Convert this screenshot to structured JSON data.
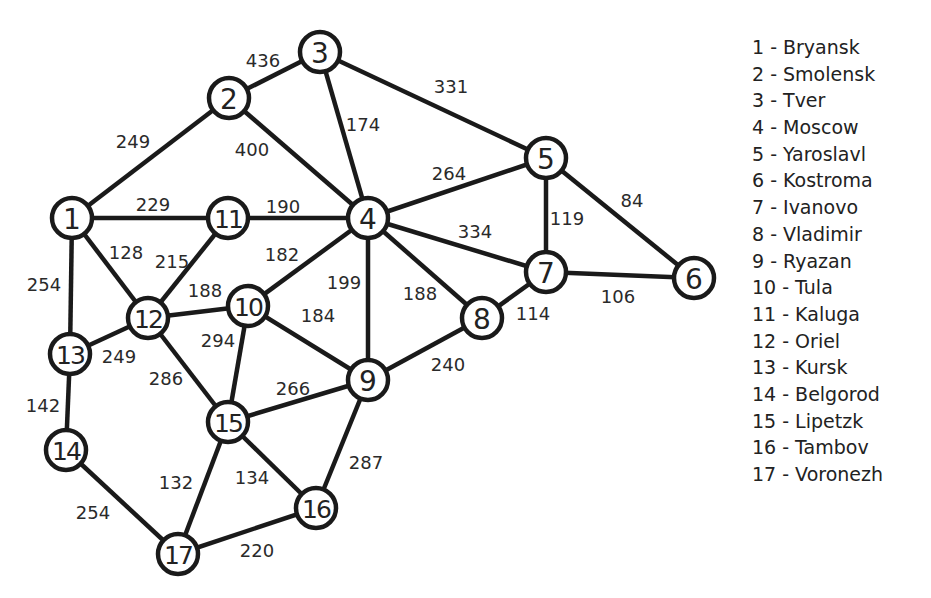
{
  "diagram": {
    "type": "weighted-undirected-graph",
    "nodes": [
      {
        "id": 1,
        "label": "1",
        "city": "Bryansk",
        "x": 72,
        "y": 218
      },
      {
        "id": 2,
        "label": "2",
        "city": "Smolensk",
        "x": 229,
        "y": 98
      },
      {
        "id": 3,
        "label": "3",
        "city": "Tver",
        "x": 320,
        "y": 52
      },
      {
        "id": 4,
        "label": "4",
        "city": "Moscow",
        "x": 368,
        "y": 218
      },
      {
        "id": 5,
        "label": "5",
        "city": "Yaroslavl",
        "x": 546,
        "y": 158
      },
      {
        "id": 6,
        "label": "6",
        "city": "Kostroma",
        "x": 694,
        "y": 278
      },
      {
        "id": 7,
        "label": "7",
        "city": "Ivanovo",
        "x": 546,
        "y": 272
      },
      {
        "id": 8,
        "label": "8",
        "city": "Vladimir",
        "x": 482,
        "y": 318
      },
      {
        "id": 9,
        "label": "9",
        "city": "Ryazan",
        "x": 368,
        "y": 380
      },
      {
        "id": 10,
        "label": "10",
        "city": "Tula",
        "x": 248,
        "y": 306
      },
      {
        "id": 11,
        "label": "11",
        "city": "Kaluga",
        "x": 228,
        "y": 218
      },
      {
        "id": 12,
        "label": "12",
        "city": "Oriel",
        "x": 148,
        "y": 318
      },
      {
        "id": 13,
        "label": "13",
        "city": "Kursk",
        "x": 70,
        "y": 354
      },
      {
        "id": 14,
        "label": "14",
        "city": "Belgorod",
        "x": 66,
        "y": 450
      },
      {
        "id": 15,
        "label": "15",
        "city": "Lipetzk",
        "x": 228,
        "y": 422
      },
      {
        "id": 16,
        "label": "16",
        "city": "Tambov",
        "x": 316,
        "y": 508
      },
      {
        "id": 17,
        "label": "17",
        "city": "Voronezh",
        "x": 178,
        "y": 554
      }
    ],
    "edges": [
      {
        "from": 1,
        "to": 2,
        "weight": "249",
        "lx": 133,
        "ly": 141
      },
      {
        "from": 2,
        "to": 3,
        "weight": "436",
        "lx": 263,
        "ly": 60
      },
      {
        "from": 2,
        "to": 4,
        "weight": "400",
        "lx": 252,
        "ly": 149
      },
      {
        "from": 3,
        "to": 4,
        "weight": "174",
        "lx": 363,
        "ly": 124
      },
      {
        "from": 3,
        "to": 5,
        "weight": "331",
        "lx": 451,
        "ly": 86
      },
      {
        "from": 1,
        "to": 11,
        "weight": "229",
        "lx": 153,
        "ly": 204
      },
      {
        "from": 11,
        "to": 4,
        "weight": "190",
        "lx": 283,
        "ly": 206
      },
      {
        "from": 4,
        "to": 5,
        "weight": "264",
        "lx": 449,
        "ly": 173
      },
      {
        "from": 5,
        "to": 7,
        "weight": "119",
        "lx": 567,
        "ly": 218
      },
      {
        "from": 5,
        "to": 6,
        "weight": "84",
        "lx": 632,
        "ly": 200
      },
      {
        "from": 4,
        "to": 7,
        "weight": "334",
        "lx": 475,
        "ly": 231
      },
      {
        "from": 7,
        "to": 6,
        "weight": "106",
        "lx": 618,
        "ly": 296
      },
      {
        "from": 4,
        "to": 8,
        "weight": "188",
        "lx": 420,
        "ly": 293
      },
      {
        "from": 8,
        "to": 7,
        "weight": "114",
        "lx": 533,
        "ly": 313
      },
      {
        "from": 4,
        "to": 10,
        "weight": "182",
        "lx": 282,
        "ly": 254
      },
      {
        "from": 4,
        "to": 9,
        "weight": "199",
        "lx": 344,
        "ly": 282
      },
      {
        "from": 9,
        "to": 8,
        "weight": "240",
        "lx": 448,
        "ly": 364
      },
      {
        "from": 1,
        "to": 12,
        "weight": "128",
        "lx": 126,
        "ly": 252
      },
      {
        "from": 11,
        "to": 12,
        "weight": "215",
        "lx": 172,
        "ly": 261
      },
      {
        "from": 12,
        "to": 10,
        "weight": "188",
        "lx": 205,
        "ly": 290
      },
      {
        "from": 10,
        "to": 9,
        "weight": "184",
        "lx": 318,
        "ly": 315
      },
      {
        "from": 1,
        "to": 13,
        "weight": "254",
        "lx": 44,
        "ly": 284
      },
      {
        "from": 13,
        "to": 12,
        "weight": "249",
        "lx": 119,
        "ly": 356
      },
      {
        "from": 12,
        "to": 15,
        "weight": "286",
        "lx": 166,
        "ly": 378
      },
      {
        "from": 10,
        "to": 15,
        "weight": "294",
        "lx": 218,
        "ly": 340
      },
      {
        "from": 15,
        "to": 9,
        "weight": "266",
        "lx": 293,
        "ly": 388
      },
      {
        "from": 13,
        "to": 14,
        "weight": "142",
        "lx": 43,
        "ly": 405
      },
      {
        "from": 9,
        "to": 16,
        "weight": "287",
        "lx": 366,
        "ly": 462
      },
      {
        "from": 15,
        "to": 16,
        "weight": "134",
        "lx": 252,
        "ly": 477
      },
      {
        "from": 15,
        "to": 17,
        "weight": "132",
        "lx": 176,
        "ly": 482
      },
      {
        "from": 14,
        "to": 17,
        "weight": "254",
        "lx": 93,
        "ly": 512
      },
      {
        "from": 17,
        "to": 16,
        "weight": "220",
        "lx": 257,
        "ly": 550
      }
    ]
  },
  "legend": {
    "items": [
      {
        "text": "1 - Bryansk"
      },
      {
        "text": "2 - Smolensk"
      },
      {
        "text": "3 - Tver"
      },
      {
        "text": "4 - Moscow"
      },
      {
        "text": "5 - Yaroslavl"
      },
      {
        "text": "6 - Kostroma"
      },
      {
        "text": "7 - Ivanovo"
      },
      {
        "text": "8 - Vladimir"
      },
      {
        "text": "9 - Ryazan"
      },
      {
        "text": "10 - Tula"
      },
      {
        "text": "11 - Kaluga"
      },
      {
        "text": "12 - Oriel"
      },
      {
        "text": "13 - Kursk"
      },
      {
        "text": "14 - Belgorod"
      },
      {
        "text": "15 - Lipetzk"
      },
      {
        "text": "16 - Tambov"
      },
      {
        "text": "17 - Voronezh"
      }
    ]
  },
  "colors": {
    "stroke": "#1a1a1a",
    "background": "#ffffff",
    "text": "#222222"
  }
}
